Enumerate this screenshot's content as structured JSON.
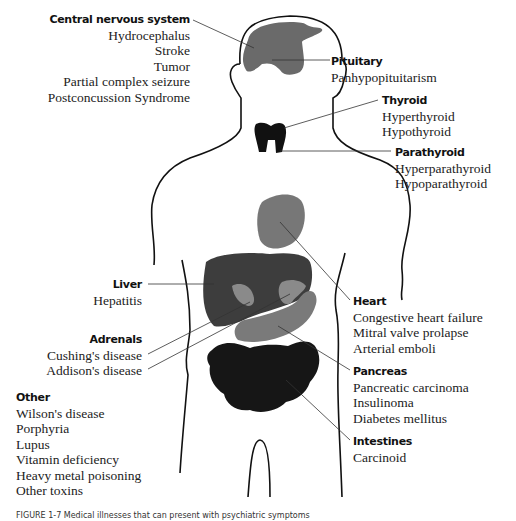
{
  "figure": {
    "colors": {
      "outline": "#111111",
      "dark_organ": "#3a3a3a",
      "mid_organ": "#6e6e6e",
      "light_organ": "#8a8a8a",
      "black_organ": "#111111",
      "leader_line": "#333333"
    },
    "labels": {
      "cns": {
        "heading": "Central nervous system",
        "items": [
          "Hydrocephalus",
          "Stroke",
          "Tumor",
          "Partial complex seizure",
          "Postconcussion Syndrome"
        ]
      },
      "pituitary": {
        "heading": "Pituitary",
        "items": [
          "Panhypopituitarism"
        ]
      },
      "thyroid": {
        "heading": "Thyroid",
        "items": [
          "Hyperthyroid",
          "Hypothyroid"
        ]
      },
      "parathyroid": {
        "heading": "Parathyroid",
        "items": [
          "Hyperparathyroid",
          "Hypoparathyroid"
        ]
      },
      "liver": {
        "heading": "Liver",
        "items": [
          "Hepatitis"
        ]
      },
      "adrenals": {
        "heading": "Adrenals",
        "items": [
          "Cushing's disease",
          "Addison's disease"
        ]
      },
      "heart": {
        "heading": "Heart",
        "items": [
          "Congestive heart failure",
          "Mitral valve prolapse",
          "Arterial emboli"
        ]
      },
      "pancreas": {
        "heading": "Pancreas",
        "items": [
          "Pancreatic carcinoma",
          "Insulinoma",
          "Diabetes mellitus"
        ]
      },
      "intestines": {
        "heading": "Intestines",
        "items": [
          "Carcinoid"
        ]
      },
      "other": {
        "heading": "Other",
        "items": [
          "Wilson's disease",
          "Porphyria",
          "Lupus",
          "Vitamin deficiency",
          "Heavy metal poisoning",
          "Other toxins"
        ]
      }
    },
    "caption": "FIGURE 1-7 Medical illnesses that can present with psychiatric symptoms"
  }
}
